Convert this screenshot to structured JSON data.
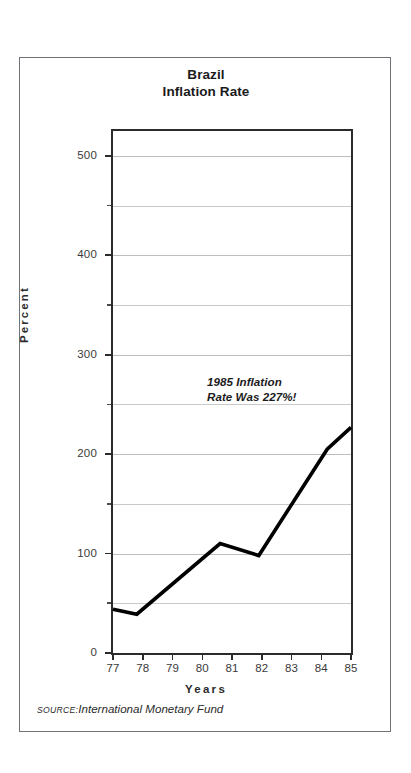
{
  "card": {
    "title_line1": "Brazil",
    "title_line2": "Inflation Rate"
  },
  "annotation": {
    "line1": "1985 Inflation",
    "line2": "Rate Was 227%!"
  },
  "source": {
    "kicker": "SOURCE:",
    "text": "International Monetary Fund"
  },
  "axes": {
    "y_title": "Percent",
    "x_title": "Years",
    "y_major_labels": [
      "500",
      "400",
      "300",
      "200",
      "100",
      "0"
    ],
    "x_labels": [
      "77",
      "78",
      "79",
      "80",
      "81",
      "82",
      "83",
      "84",
      "85"
    ]
  },
  "colors": {
    "line": "#000000",
    "frame": "#2b2b2b",
    "grid": "#c9c9c9",
    "card_border": "#6f7276",
    "text": "#2b2b2b",
    "background": "#ffffff"
  },
  "chart_data": {
    "type": "line",
    "title": "Brazil Inflation Rate",
    "xlabel": "Years",
    "ylabel": "Percent",
    "xlim": [
      77,
      85
    ],
    "ylim": [
      0,
      525
    ],
    "grid": true,
    "grid_major_step": 100,
    "grid_minor_step": 50,
    "legend": "none",
    "x_tick_labels": [
      "77",
      "78",
      "79",
      "80",
      "81",
      "82",
      "83",
      "84",
      "85"
    ],
    "y_tick_labels": [
      "0",
      "100",
      "200",
      "300",
      "400",
      "500"
    ],
    "y_ticks": [
      0,
      100,
      200,
      300,
      400,
      500
    ],
    "x": [
      77.0,
      77.8,
      80.6,
      81.9,
      84.2,
      85.0
    ],
    "values": [
      44,
      39,
      110,
      98,
      205,
      227
    ],
    "series": [
      {
        "name": "Brazil inflation rate",
        "x": [
          77.0,
          77.8,
          80.6,
          81.9,
          84.2,
          85.0
        ],
        "values": [
          44,
          39,
          110,
          98,
          205,
          227
        ]
      }
    ],
    "annotations": [
      {
        "text": "1985 Inflation Rate Was 227%!",
        "x": 83.0,
        "y": 235
      }
    ]
  }
}
